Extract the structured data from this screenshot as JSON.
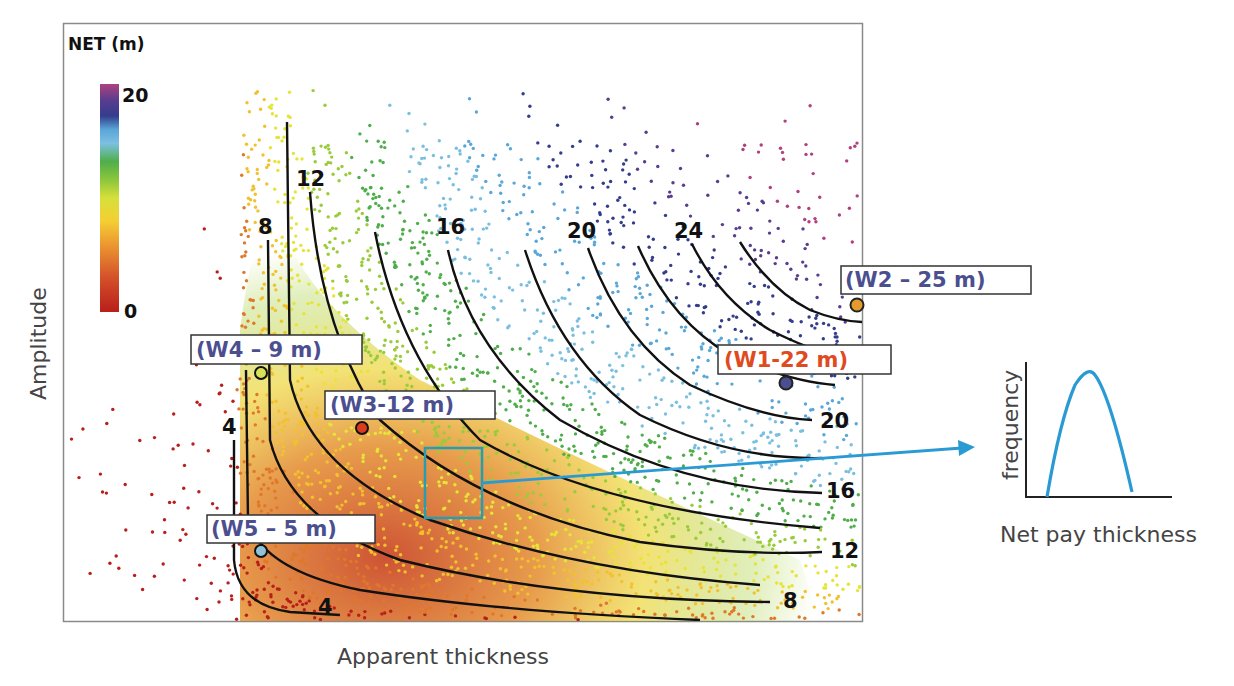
{
  "chart_data": [
    {
      "type": "scatter",
      "title": "",
      "xlabel": "Apparent thickness",
      "ylabel": "Amplitude",
      "grid": false,
      "colorbar": {
        "title": "NET (m)",
        "min_label": "0",
        "max_label": "20",
        "range": [
          0,
          20
        ],
        "colors": [
          "#b81f1a",
          "#e0782a",
          "#f2c12e",
          "#e6e437",
          "#9acc3a",
          "#4fae4a",
          "#7bbfe0",
          "#5aa6d8",
          "#343d8c",
          "#5a3d8e",
          "#b0407f"
        ]
      },
      "contours": [
        {
          "label": "4",
          "label_positions": [
            [
              230,
              428
            ],
            [
              318,
              612
            ]
          ]
        },
        {
          "label": "8",
          "label_positions": [
            [
              268,
              228
            ],
            [
              780,
              602
            ]
          ]
        },
        {
          "label": "12",
          "label_positions": [
            [
              312,
              180
            ],
            [
              845,
              552
            ]
          ]
        },
        {
          "label": "16",
          "label_positions": [
            [
              452,
              228
            ],
            [
              848,
              492
            ]
          ]
        },
        {
          "label": "20",
          "label_positions": [
            [
              586,
              232
            ],
            [
              838,
              422
            ]
          ]
        },
        {
          "label": "24",
          "label_positions": [
            [
              692,
              232
            ]
          ]
        }
      ],
      "wells": [
        {
          "name": "W1",
          "label": "(W1-22 m)",
          "net_m": 22,
          "color": "#4b4f8f",
          "label_color": "#e04a1f"
        },
        {
          "name": "W2",
          "label": "(W2 – 25 m)",
          "net_m": 25,
          "color": "#e69a2e",
          "label_color": "#4b4f8f"
        },
        {
          "name": "W3",
          "label": "(W3-12 m)",
          "net_m": 12,
          "color": "#d93a20",
          "label_color": "#4b4f8f"
        },
        {
          "name": "W4",
          "label": "(W4 – 9 m)",
          "net_m": 9,
          "color": "#d9e05a",
          "label_color": "#4b4f8f"
        },
        {
          "name": "W5",
          "label": "(W5 – 5 m)",
          "net_m": 5,
          "color": "#8fc4d8",
          "label_color": "#4b4f8f"
        }
      ],
      "selection_box_color": "#2a9cad",
      "arrow_color": "#2a9ad4"
    },
    {
      "type": "line",
      "title": "",
      "xlabel": "Net pay thickness",
      "ylabel": "frequency",
      "series": [
        {
          "name": "distribution",
          "shape": "unimodal bell",
          "color": "#2a9ad4"
        }
      ]
    }
  ],
  "main_plot": {
    "colorbar_title": "NET (m)",
    "colorbar_max": "20",
    "colorbar_min": "0",
    "x_axis_label": "Apparent thickness",
    "y_axis_label": "Amplitude",
    "contour_labels_top": [
      "8",
      "12",
      "16",
      "20",
      "24"
    ],
    "contour_labels_right": [
      "20",
      "16",
      "12",
      "8"
    ],
    "contour_labels_bottom": [
      "4",
      "4"
    ],
    "wells": {
      "w1": "(W1-22 m)",
      "w2": "(W2 – 25 m)",
      "w3": "(W3-12 m)",
      "w4": "(W4 – 9 m)",
      "w5": "(W5 – 5 m)"
    }
  },
  "inset_plot": {
    "x_axis_label": "Net pay thickness",
    "y_axis_label": "frequency"
  }
}
